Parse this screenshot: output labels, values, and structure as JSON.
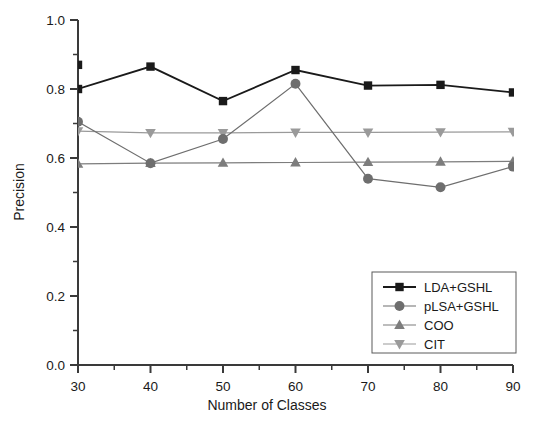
{
  "chart_data": {
    "type": "line",
    "title": "",
    "xlabel": "Number of Classes",
    "ylabel": "Precision",
    "x": [
      30,
      40,
      50,
      60,
      70,
      80,
      90
    ],
    "xlim": [
      30,
      90
    ],
    "ylim": [
      0.0,
      1.0
    ],
    "xticks": [
      30,
      40,
      50,
      60,
      70,
      80,
      90
    ],
    "xtick_labels": [
      "30",
      "40",
      "50",
      "60",
      "70",
      "80",
      "90"
    ],
    "yticks": [
      0.0,
      0.2,
      0.4,
      0.6,
      0.8,
      1.0
    ],
    "ytick_labels": [
      "0.0",
      "0.2",
      "0.4",
      "0.6",
      "0.8",
      "1.0"
    ],
    "x_minor_ticks": [
      35,
      45,
      55,
      65,
      75,
      85
    ],
    "y_minor_ticks": [
      0.1,
      0.3,
      0.5,
      0.7,
      0.9
    ],
    "grid": false,
    "legend_position": "lower right",
    "series": [
      {
        "name": "LDA+GSHL",
        "marker": "square",
        "color": "#1a1a1a",
        "values": [
          0.8,
          0.865,
          0.765,
          0.855,
          0.81,
          0.812,
          0.79
        ],
        "extra_points": [
          {
            "x": 30,
            "y": 0.87
          }
        ]
      },
      {
        "name": "pLSA+GSHL",
        "marker": "circle",
        "color": "#6e6e6e",
        "values": [
          0.705,
          0.585,
          0.655,
          0.815,
          0.54,
          0.515,
          0.575
        ]
      },
      {
        "name": "COO",
        "marker": "triangle-up",
        "color": "#7d7d7d",
        "values": [
          0.583,
          0.585,
          0.586,
          0.587,
          0.588,
          0.589,
          0.59
        ]
      },
      {
        "name": "CIT",
        "marker": "triangle-down",
        "color": "#9a9a9a",
        "values": [
          0.678,
          0.673,
          0.673,
          0.674,
          0.674,
          0.675,
          0.676
        ]
      }
    ]
  },
  "legend": {
    "items": [
      {
        "label": "LDA+GSHL",
        "marker": "square",
        "color": "#1a1a1a"
      },
      {
        "label": "pLSA+GSHL",
        "marker": "circle",
        "color": "#6e6e6e"
      },
      {
        "label": "COO",
        "marker": "triangle-up",
        "color": "#7d7d7d"
      },
      {
        "label": "CIT",
        "marker": "triangle-down",
        "color": "#9a9a9a"
      }
    ]
  },
  "colors": {
    "axis": "#3a3a3a",
    "text": "#1a1a1a",
    "background": "#ffffff",
    "lda": "#1a1a1a",
    "plsa": "#6e6e6e",
    "coo": "#7d7d7d",
    "cit": "#9a9a9a"
  }
}
